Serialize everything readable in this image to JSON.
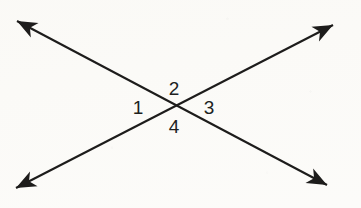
{
  "figure": {
    "kind": "geometry-diagram",
    "width": 361,
    "height": 208,
    "background_color": "#fbfaf7",
    "stroke_color": "#1d1c1b",
    "text_color": "#201f1e",
    "stroke_width": 2.1
  },
  "lines": [
    {
      "name": "line-nw-se",
      "icon": "double-headed-arrow-icon",
      "from": {
        "x": 17,
        "y": 21
      },
      "to": {
        "x": 327,
        "y": 185
      },
      "arrowhead_start": "barbed-arrowhead",
      "arrowhead_end": "barbed-arrowhead"
    },
    {
      "name": "line-sw-ne",
      "icon": "double-headed-arrow-icon",
      "from": {
        "x": 16,
        "y": 188
      },
      "to": {
        "x": 333,
        "y": 25
      },
      "arrowhead_start": "barbed-arrowhead",
      "arrowhead_end": "barbed-arrowhead"
    }
  ],
  "intersection": {
    "x": 176,
    "y": 108
  },
  "labels": [
    {
      "id": "1",
      "text": "1",
      "position": "left",
      "x": 138,
      "y": 107
    },
    {
      "id": "2",
      "text": "2",
      "position": "top",
      "x": 174,
      "y": 88
    },
    {
      "id": "3",
      "text": "3",
      "position": "right",
      "x": 209,
      "y": 107
    },
    {
      "id": "4",
      "text": "4",
      "position": "bottom",
      "x": 174,
      "y": 126
    }
  ]
}
